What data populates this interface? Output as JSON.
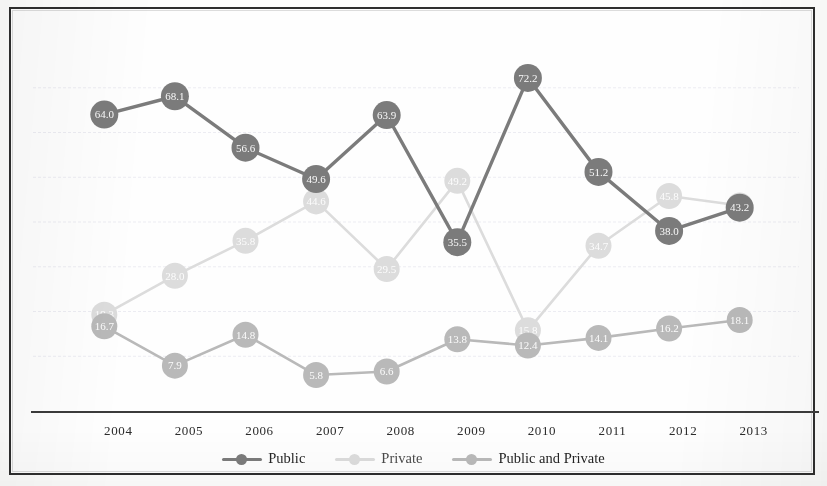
{
  "chart_data": {
    "type": "line",
    "title": "",
    "subtitle": "",
    "xlabel": "",
    "ylabel": "",
    "categories": [
      "2004",
      "2005",
      "2006",
      "2007",
      "2008",
      "2009",
      "2010",
      "2011",
      "2012",
      "2013"
    ],
    "ylim": [
      0,
      80
    ],
    "grid": true,
    "gridlines": [
      10,
      20,
      30,
      40,
      50,
      60,
      70
    ],
    "legend_position": "bottom",
    "series": [
      {
        "name": "Public",
        "color": "#7b7b7b",
        "values": [
          64.0,
          68.1,
          56.6,
          49.6,
          63.9,
          35.5,
          72.2,
          51.2,
          38.0,
          43.2
        ],
        "labels": [
          "64.0",
          "68.1",
          "56.6",
          "49.6",
          "63.9",
          "35.5",
          "72.2",
          "51.2",
          "38.0",
          "43.2"
        ]
      },
      {
        "name": "Private",
        "color": "#dcdcdc",
        "values": [
          19.3,
          28.0,
          35.8,
          44.6,
          29.5,
          49.2,
          15.8,
          34.7,
          45.8,
          43.7
        ],
        "labels": [
          "19.3",
          "28.0",
          "35.8",
          "44.6",
          "29.5",
          "49.2",
          "15.8",
          "34.7",
          "45.8",
          "43.7"
        ]
      },
      {
        "name": "Public and Private",
        "color": "#b9b9b9",
        "values": [
          16.7,
          7.9,
          14.8,
          5.8,
          6.6,
          13.8,
          12.4,
          14.1,
          16.2,
          18.1
        ],
        "labels": [
          "16.7",
          "7.9",
          "14.8",
          "5.8",
          "6.6",
          "13.8",
          "12.4",
          "14.1",
          "16.2",
          "18.1"
        ]
      }
    ]
  },
  "legend": {
    "items": [
      {
        "label": "Public",
        "color": "#7b7b7b"
      },
      {
        "label": "Private",
        "color": "#dcdcdc"
      },
      {
        "label": "Public and Private",
        "color": "#b9b9b9"
      }
    ]
  },
  "axis": {
    "x_ticks": [
      "2004",
      "2005",
      "2006",
      "2007",
      "2008",
      "2009",
      "2010",
      "2011",
      "2012",
      "2013"
    ]
  },
  "colors": {
    "public": "#7b7b7b",
    "private": "#dcdcdc",
    "public_and_private": "#b9b9b9",
    "axis": "#3b3b3b",
    "grid": "#ececf2",
    "frame": "#2e2e2e",
    "background": "#fefefe"
  }
}
